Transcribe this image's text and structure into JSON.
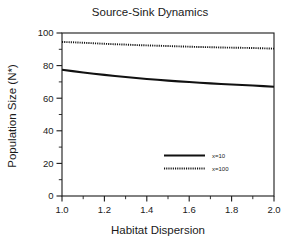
{
  "chart_data": {
    "type": "line",
    "title": "Source-Sink Dynamics",
    "xlabel": "Habitat Dispersion",
    "ylabel": "Population Size (N*)",
    "xlim": [
      1.0,
      2.0
    ],
    "ylim": [
      0,
      100
    ],
    "xticks": [
      "1.0",
      "1.2",
      "1.4",
      "1.6",
      "1.8",
      "2.0"
    ],
    "xtick_values": [
      1.0,
      1.2,
      1.4,
      1.6,
      1.8,
      2.0
    ],
    "yticks": [
      "0",
      "20",
      "40",
      "60",
      "80",
      "100"
    ],
    "ytick_values": [
      0,
      20,
      40,
      60,
      80,
      100
    ],
    "x_minor_step": 0.1,
    "y_minor_step": 10,
    "grid": false,
    "legend_position": "center-right-inside",
    "frame": "box",
    "tick_direction": "out",
    "x": [
      1.0,
      1.05,
      1.1,
      1.15,
      1.2,
      1.25,
      1.3,
      1.35,
      1.4,
      1.45,
      1.5,
      1.55,
      1.6,
      1.65,
      1.7,
      1.75,
      1.8,
      1.85,
      1.9,
      1.95,
      2.0
    ],
    "series": [
      {
        "name": "x=10",
        "style": "solid",
        "color": "#111111",
        "values": [
          77.5,
          76.6,
          75.8,
          75.0,
          74.3,
          73.6,
          73.0,
          72.4,
          71.8,
          71.3,
          70.8,
          70.3,
          69.9,
          69.5,
          69.1,
          68.7,
          68.4,
          68.1,
          67.8,
          67.4,
          67.0
        ]
      },
      {
        "name": "x=100",
        "style": "dotted",
        "color": "#111111",
        "values": [
          94.5,
          94.3,
          94.0,
          93.7,
          93.4,
          93.1,
          92.9,
          92.6,
          92.4,
          92.2,
          92.0,
          91.8,
          91.6,
          91.4,
          91.3,
          91.1,
          91.0,
          90.9,
          90.8,
          90.6,
          90.4
        ]
      }
    ]
  },
  "legend": {
    "entries": [
      {
        "label": "x=10",
        "style": "solid"
      },
      {
        "label": "x=100",
        "style": "dotted"
      }
    ]
  }
}
